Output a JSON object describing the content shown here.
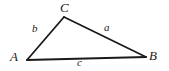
{
  "figure": {
    "kind": "geometry-diagram",
    "shape": "triangle",
    "background_color": "#ffffff",
    "stroke_color": "#1a1a1a",
    "stroke_width": 1.8,
    "text_color": "#1a1a1a",
    "canvas": {
      "width": 169,
      "height": 71
    }
  },
  "vertices": [
    {
      "id": "A",
      "label": "A",
      "x": 27,
      "y": 60
    },
    {
      "id": "B",
      "label": "B",
      "x": 146,
      "y": 57
    },
    {
      "id": "C",
      "label": "C",
      "x": 64,
      "y": 17
    }
  ],
  "sides": [
    {
      "id": "a",
      "label": "a",
      "from": "C",
      "to": "B"
    },
    {
      "id": "b",
      "label": "b",
      "from": "A",
      "to": "C"
    },
    {
      "id": "c",
      "label": "c",
      "from": "A",
      "to": "B"
    }
  ],
  "labels": {
    "vertex_A": "A",
    "vertex_B": "B",
    "vertex_C": "C",
    "side_a": "a",
    "side_b": "b",
    "side_c": "c"
  }
}
